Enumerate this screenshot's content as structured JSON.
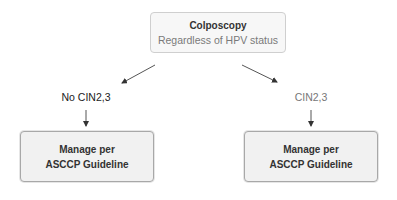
{
  "diagram": {
    "root": {
      "title": "Colposcopy",
      "subtitle": "Regardless of HPV status"
    },
    "branches": [
      {
        "label": "No CIN2,3",
        "outcome": {
          "line1": "Manage per",
          "line2": "ASCCP Guideline"
        }
      },
      {
        "label": "CIN2,3",
        "outcome": {
          "line1": "Manage per",
          "line2": "ASCCP Guideline"
        }
      }
    ],
    "colors": {
      "box_fill": "#f1f1f1",
      "box_border": "#a8a8a8",
      "arrow": "#444444",
      "muted_text": "#777777"
    }
  }
}
